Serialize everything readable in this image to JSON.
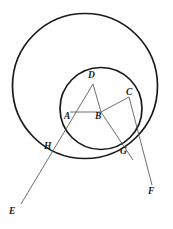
{
  "figure": {
    "width": 173,
    "height": 229,
    "background_color": "#ffffff",
    "stroke_color_circle": "#1a1a1a",
    "stroke_color_line": "#555555",
    "label_color": "#1a1a1a"
  },
  "shapes": {
    "outer_circle": {
      "name": "outer-circle",
      "cx": 85,
      "cy": 86,
      "r": 72.5,
      "stroke_width": 1.6
    },
    "inner_circle": {
      "name": "inner-circle",
      "cx": 101,
      "cy": 108.5,
      "r": 41,
      "stroke_width": 1.6
    }
  },
  "points": {
    "A": {
      "label": "A",
      "x": 70,
      "y": 112,
      "label_x": 65,
      "label_y": 113
    },
    "B": {
      "label": "B",
      "x": 101,
      "y": 112,
      "label_x": 96,
      "label_y": 113
    },
    "C": {
      "label": "C",
      "x": 129,
      "y": 97,
      "label_x": 126,
      "label_y": 88
    },
    "D": {
      "label": "D",
      "x": 93,
      "y": 84,
      "label_x": 88,
      "label_y": 71
    },
    "E": {
      "label": "E",
      "x": 21,
      "y": 203,
      "label_x": 10,
      "label_y": 208
    },
    "F": {
      "label": "F",
      "x": 152,
      "y": 185,
      "label_x": 149,
      "label_y": 188
    },
    "G": {
      "label": "G",
      "x": 126,
      "y": 147,
      "label_x": 121,
      "label_y": 148
    },
    "H": {
      "label": "H",
      "x": 53,
      "y": 140,
      "label_x": 45,
      "label_y": 142
    }
  },
  "segments": [
    {
      "name": "segment-ab",
      "from": "A",
      "to": "B"
    },
    {
      "name": "segment-da",
      "from": "D",
      "to": "A"
    },
    {
      "name": "segment-db",
      "from": "D",
      "to": "B"
    },
    {
      "name": "ray-d-to-e",
      "from": "D",
      "to": "E"
    },
    {
      "name": "ray-c-to-f",
      "from": "C",
      "to": "F"
    }
  ],
  "labels": [
    "A",
    "B",
    "C",
    "D",
    "E",
    "F",
    "G",
    "H"
  ]
}
